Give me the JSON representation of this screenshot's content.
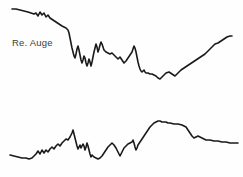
{
  "figure": {
    "background_color": "#fefefe",
    "trace_color": "#1a1a1a",
    "label_color": "#3c3c3c",
    "width": 243,
    "height": 177
  },
  "traces": {
    "right_eye": {
      "label": "Re. Auge",
      "label_name": "right-eye-label"
    },
    "left_eye": {
      "label": "Li.Auge",
      "label_name": "left-eye-label"
    }
  },
  "chart_data": {
    "type": "line",
    "title": "",
    "subtitle": "",
    "xlabel": "",
    "ylabel": "",
    "grid": false,
    "legend_position": "inline-left",
    "axis_visible": false,
    "tick_labels": [],
    "annotations": [
      "Re. Auge",
      "Li.Auge"
    ],
    "note": "Two stacked unlabelled biosignal traces (right eye above, left eye below). Values are pixel-space y positions of the hand-digitised curve; y increases downward in image coordinates.",
    "xlim": [
      0,
      243
    ],
    "ylim": [
      0,
      177
    ],
    "series": [
      {
        "name": "Re. Auge",
        "panel": "right_eye",
        "x": [
          12,
          16,
          20,
          24,
          28,
          31,
          34,
          36,
          38,
          40,
          42,
          44,
          46,
          48,
          50,
          53,
          56,
          59,
          62,
          64,
          66,
          68,
          69,
          70,
          71,
          72,
          73,
          74,
          75,
          76,
          77,
          78,
          79,
          80,
          81,
          82,
          83,
          84,
          85,
          86,
          87,
          88,
          89,
          90,
          91,
          92,
          93,
          94,
          95,
          96,
          97,
          98,
          99,
          100,
          101,
          102,
          103,
          104,
          106,
          108,
          110,
          112,
          114,
          116,
          118,
          120,
          122,
          124,
          126,
          128,
          130,
          132,
          133,
          134,
          135,
          136,
          137,
          138,
          139,
          140,
          141,
          142,
          143,
          144,
          145,
          146,
          148,
          150,
          152,
          154,
          156,
          158,
          160,
          163,
          166,
          169,
          172,
          175,
          178,
          181,
          184,
          187,
          190,
          193,
          196,
          199,
          202,
          205,
          207,
          209,
          211,
          213,
          215,
          218,
          221,
          224,
          227,
          230,
          232
        ],
        "y": [
          9,
          9,
          10,
          11,
          12,
          13,
          14,
          13,
          16,
          12,
          15,
          13,
          17,
          15,
          18,
          20,
          22,
          24,
          26,
          27,
          28,
          30,
          33,
          38,
          43,
          48,
          52,
          56,
          58,
          54,
          49,
          46,
          50,
          55,
          60,
          63,
          60,
          56,
          58,
          63,
          66,
          63,
          59,
          62,
          66,
          62,
          57,
          52,
          48,
          44,
          47,
          52,
          49,
          45,
          42,
          44,
          47,
          50,
          52,
          53,
          54,
          53,
          55,
          57,
          59,
          57,
          60,
          63,
          61,
          58,
          55,
          52,
          49,
          46,
          48,
          52,
          57,
          62,
          66,
          69,
          71,
          72,
          71,
          70,
          72,
          73,
          73,
          74,
          74,
          75,
          76,
          78,
          79,
          76,
          73,
          72,
          74,
          76,
          73,
          70,
          68,
          66,
          64,
          62,
          60,
          58,
          56,
          54,
          52,
          50,
          48,
          46,
          44,
          43,
          41,
          39,
          37,
          36,
          36
        ]
      },
      {
        "name": "Li.Auge",
        "panel": "left_eye",
        "x": [
          10,
          14,
          18,
          22,
          26,
          29,
          32,
          34,
          36,
          38,
          40,
          42,
          44,
          46,
          48,
          50,
          52,
          54,
          56,
          58,
          60,
          62,
          64,
          66,
          68,
          70,
          72,
          73,
          74,
          75,
          76,
          77,
          78,
          79,
          80,
          81,
          82,
          83,
          84,
          85,
          86,
          87,
          88,
          89,
          90,
          91,
          92,
          94,
          96,
          98,
          100,
          102,
          104,
          106,
          108,
          110,
          112,
          114,
          116,
          118,
          120,
          122,
          124,
          126,
          128,
          130,
          132,
          133,
          134,
          135,
          136,
          137,
          138,
          140,
          142,
          144,
          146,
          148,
          150,
          152,
          154,
          156,
          158,
          160,
          162,
          164,
          166,
          168,
          170,
          174,
          178,
          182,
          186,
          188,
          190,
          192,
          194,
          196,
          198,
          200,
          202,
          204,
          206,
          210,
          214,
          218,
          222,
          226,
          230,
          234,
          238
        ],
        "y": [
          155,
          156,
          157,
          158,
          158,
          159,
          158,
          156,
          154,
          151,
          154,
          150,
          153,
          150,
          152,
          149,
          147,
          149,
          146,
          144,
          146,
          143,
          141,
          139,
          140,
          137,
          133,
          130,
          134,
          138,
          142,
          146,
          149,
          147,
          145,
          148,
          146,
          144,
          146,
          150,
          147,
          143,
          146,
          150,
          154,
          157,
          155,
          157,
          158,
          159,
          158,
          156,
          153,
          150,
          147,
          145,
          143,
          145,
          148,
          152,
          156,
          152,
          148,
          146,
          144,
          143,
          142,
          140,
          143,
          147,
          150,
          148,
          145,
          142,
          139,
          136,
          133,
          130,
          127,
          125,
          123,
          122,
          121,
          121,
          122,
          122,
          122,
          123,
          123,
          124,
          124,
          125,
          127,
          130,
          133,
          136,
          138,
          137,
          136,
          137,
          138,
          139,
          140,
          140,
          141,
          141,
          142,
          142,
          143,
          143,
          143
        ]
      }
    ]
  }
}
